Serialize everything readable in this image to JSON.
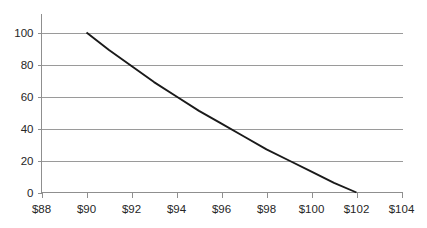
{
  "chart_data": {
    "type": "line",
    "title": "",
    "subtitle": "",
    "xlabel": "",
    "ylabel": "",
    "xlim": [
      88,
      104
    ],
    "ylim": [
      0,
      100
    ],
    "grid": true,
    "grid_axis": "y",
    "legend": false,
    "legend_position": "none",
    "x_tick_labels": [
      "$88",
      "$90",
      "$92",
      "$94",
      "$96",
      "$98",
      "$100",
      "$102",
      "$104"
    ],
    "x_tick_values": [
      88,
      90,
      92,
      94,
      96,
      98,
      100,
      102,
      104
    ],
    "y_tick_labels": [
      "0",
      "20",
      "40",
      "60",
      "80",
      "100"
    ],
    "y_tick_values": [
      0,
      20,
      40,
      60,
      80,
      100
    ],
    "series": [
      {
        "name": "",
        "color": "#1a1a1a",
        "x": [
          90,
          91,
          92,
          93,
          94,
          95,
          96,
          97,
          98,
          99,
          100,
          101,
          102
        ],
        "values": [
          100,
          89,
          79,
          69,
          60,
          51,
          43,
          35,
          27,
          20,
          13,
          6,
          0
        ]
      }
    ]
  },
  "axis": {
    "y_axis_color": "#8f8f8f",
    "x_axis_color": "#8f8f8f",
    "grid_color": "#9a9a9a"
  }
}
